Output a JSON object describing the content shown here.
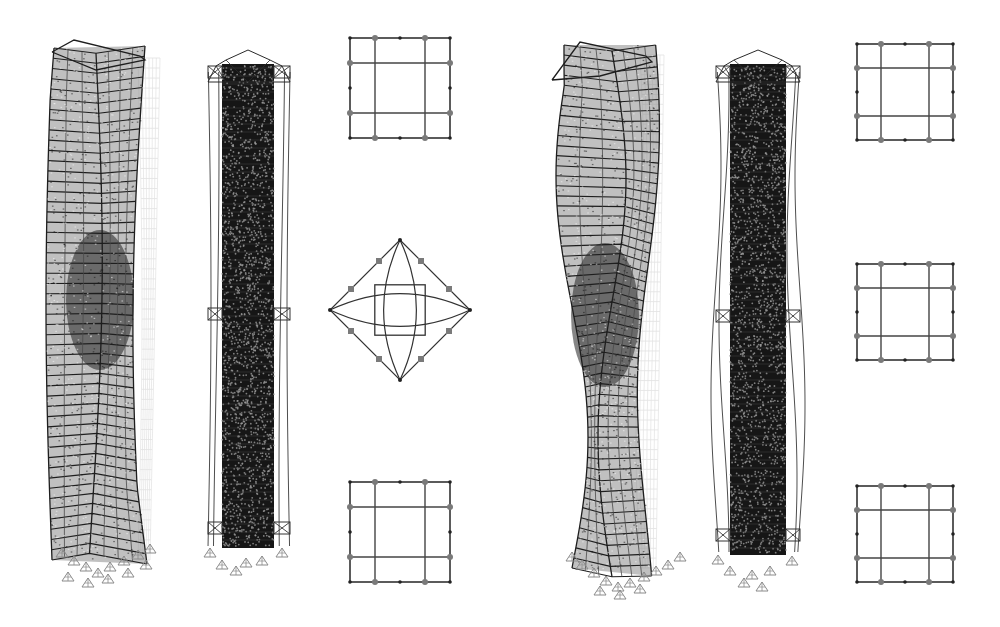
{
  "figure": {
    "background": "#ffffff",
    "colors": {
      "frame_dark": "#1e1e1e",
      "frame_mid": "#4a4a4a",
      "frame_light": "#9a9a9a",
      "ghost": "#c4c4c4",
      "support": "#8a8a8a",
      "node_large": "#7a7a7a"
    },
    "panels": [
      {
        "id": "left",
        "towers": [
          {
            "type": "deformed-frame-tower",
            "floors": 48,
            "twist": "single-wave"
          },
          {
            "type": "core-outrigger-tower",
            "outrigger_levels": 3
          }
        ],
        "floor_plans": [
          {
            "shape": "square-grid",
            "position": "top"
          },
          {
            "shape": "diamond-curved",
            "position": "middle"
          },
          {
            "shape": "square-grid",
            "position": "bottom"
          }
        ]
      },
      {
        "id": "right",
        "towers": [
          {
            "type": "deformed-frame-tower",
            "floors": 48,
            "twist": "double-wave"
          },
          {
            "type": "core-outrigger-tower",
            "outrigger_levels": 3
          }
        ],
        "floor_plans": [
          {
            "shape": "square-grid",
            "position": "top"
          },
          {
            "shape": "square-grid",
            "position": "middle"
          },
          {
            "shape": "square-grid",
            "position": "bottom"
          }
        ]
      }
    ]
  }
}
